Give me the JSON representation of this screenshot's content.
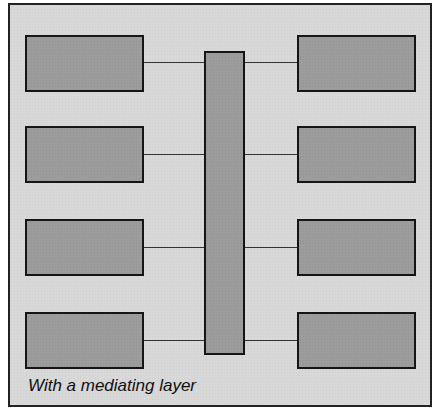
{
  "diagram": {
    "caption": "With a mediating layer",
    "colors": {
      "background": "#d8d8d8",
      "box_fill": "#9c9c9c",
      "border": "#151515",
      "connector": "#333333"
    },
    "left_nodes": [
      {
        "id": "left-1"
      },
      {
        "id": "left-2"
      },
      {
        "id": "left-3"
      },
      {
        "id": "left-4"
      }
    ],
    "mediator": {
      "id": "mediating-layer"
    },
    "right_nodes": [
      {
        "id": "right-1"
      },
      {
        "id": "right-2"
      },
      {
        "id": "right-3"
      },
      {
        "id": "right-4"
      }
    ],
    "connections": [
      [
        "left-1",
        "mediating-layer"
      ],
      [
        "left-2",
        "mediating-layer"
      ],
      [
        "left-3",
        "mediating-layer"
      ],
      [
        "left-4",
        "mediating-layer"
      ],
      [
        "mediating-layer",
        "right-1"
      ],
      [
        "mediating-layer",
        "right-2"
      ],
      [
        "mediating-layer",
        "right-3"
      ],
      [
        "mediating-layer",
        "right-4"
      ]
    ]
  }
}
